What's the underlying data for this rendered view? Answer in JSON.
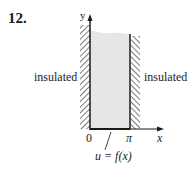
{
  "problem": {
    "number": "12."
  },
  "diagram": {
    "axes": {
      "x_label": "x",
      "y_label": "y"
    },
    "ticks": {
      "origin": "0",
      "right": "π"
    },
    "boundaries": {
      "left_label": "insulated",
      "right_label": "insulated",
      "bottom_condition": "u = f(x)"
    },
    "colors": {
      "region_fill": "#e6e6e6",
      "line": "#1a1a1a",
      "hatch": "#333333"
    }
  }
}
